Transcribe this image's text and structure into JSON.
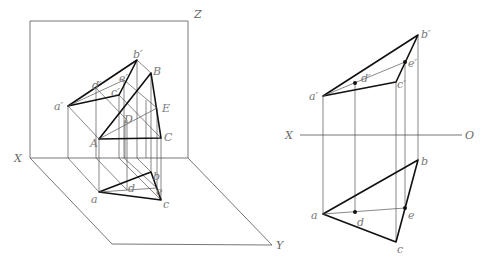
{
  "figure": {
    "left_view": {
      "axis_labels": {
        "x": "X",
        "y": "Y",
        "z": "Z"
      },
      "space_points": {
        "A": "A",
        "B": "B",
        "C": "C",
        "D": "D",
        "E": "E"
      },
      "front_projections": {
        "a": "a′",
        "b": "b′",
        "c": "c′",
        "d": "d′",
        "e": "e′"
      },
      "top_projections": {
        "a": "a",
        "b": "b",
        "c": "c",
        "d": "d",
        "e": "e"
      }
    },
    "right_view": {
      "axis_labels": {
        "x": "X",
        "o": "O"
      },
      "front_projections": {
        "a": "a′",
        "b": "b′",
        "c": "c′",
        "d": "d′",
        "e": "e′"
      },
      "top_projections": {
        "a": "a",
        "b": "b",
        "c": "c",
        "d": "d",
        "e": "e"
      }
    }
  }
}
